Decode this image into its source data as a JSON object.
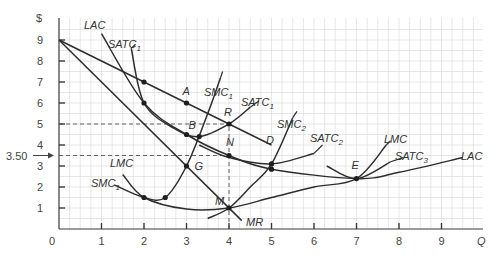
{
  "chart_data": {
    "type": "line",
    "title": "",
    "xlabel": "Q",
    "ylabel": "$",
    "xlim": [
      0,
      10
    ],
    "ylim": [
      0,
      9.5
    ],
    "grid": true,
    "x_ticks": [
      "1",
      "2",
      "3",
      "4",
      "5",
      "6",
      "7",
      "8",
      "9"
    ],
    "y_ticks": [
      "1",
      "2",
      "3",
      "4",
      "5",
      "6",
      "7",
      "8",
      "9"
    ],
    "origin_label": "0",
    "y_annotation": "3.50",
    "series": [
      {
        "name": "D",
        "points": [
          [
            0,
            9
          ],
          [
            2,
            7
          ],
          [
            3,
            6
          ],
          [
            4,
            5
          ],
          [
            5,
            4
          ]
        ]
      },
      {
        "name": "MR",
        "points": [
          [
            0,
            9
          ],
          [
            2,
            5
          ],
          [
            4,
            1
          ],
          [
            4.3,
            0.4
          ]
        ]
      },
      {
        "name": "LAC",
        "points": [
          [
            1,
            9.3
          ],
          [
            2,
            6
          ],
          [
            3,
            4.5
          ],
          [
            4,
            3.5
          ],
          [
            5,
            2.85
          ],
          [
            7,
            2.4
          ],
          [
            8,
            2.7
          ],
          [
            9.5,
            3.4
          ]
        ]
      },
      {
        "name": "SATC1",
        "points": [
          [
            1.7,
            8.6
          ],
          [
            2,
            6
          ],
          [
            2.7,
            4.8
          ],
          [
            3.3,
            4.4
          ],
          [
            4,
            5
          ],
          [
            4.5,
            5.8
          ]
        ]
      },
      {
        "name": "SMC1",
        "points": [
          [
            1.3,
            2.1
          ],
          [
            2,
            1.5
          ],
          [
            2.5,
            1.5
          ],
          [
            3,
            3
          ],
          [
            3.5,
            5.5
          ],
          [
            3.8,
            7.2
          ]
        ]
      },
      {
        "name": "SATC2",
        "points": [
          [
            3.3,
            4
          ],
          [
            4,
            3.4
          ],
          [
            5,
            3.1
          ],
          [
            6,
            3.6
          ]
        ]
      },
      {
        "name": "SMC2",
        "points": [
          [
            3.5,
            0.5
          ],
          [
            4,
            1
          ],
          [
            4.5,
            2
          ],
          [
            5,
            3.1
          ],
          [
            5.5,
            5.3
          ]
        ]
      },
      {
        "name": "SATC3",
        "points": [
          [
            6.3,
            3
          ],
          [
            7,
            2.4
          ],
          [
            7.8,
            3.2
          ]
        ]
      },
      {
        "name": "LMC",
        "points": [
          [
            1.5,
            2.6
          ],
          [
            2,
            1.5
          ],
          [
            3,
            0.95
          ],
          [
            4,
            1
          ],
          [
            5,
            1.5
          ],
          [
            6,
            2
          ],
          [
            7,
            2.4
          ],
          [
            7.7,
            4
          ]
        ]
      }
    ],
    "labeled_points": [
      {
        "label": "A",
        "q": 3,
        "p": 6
      },
      {
        "label": "B",
        "q": 3,
        "p": 4.5
      },
      {
        "label": "R",
        "q": 4,
        "p": 5
      },
      {
        "label": "N",
        "q": 4,
        "p": 3.5
      },
      {
        "label": "G",
        "q": 3,
        "p": 3
      },
      {
        "label": "M",
        "q": 4,
        "p": 1
      },
      {
        "label": "E",
        "q": 7,
        "p": 2.4
      }
    ],
    "unlabeled_points": [
      [
        2,
        7
      ],
      [
        2,
        6
      ],
      [
        2,
        1.5
      ],
      [
        2.5,
        1.5
      ],
      [
        3.3,
        4.4
      ],
      [
        5,
        3.1
      ],
      [
        5,
        2.85
      ]
    ],
    "reference_lines": [
      {
        "type": "horizontal",
        "y": 5,
        "x_to": 4
      },
      {
        "type": "horizontal",
        "y": 3.5,
        "x_to": 4
      },
      {
        "type": "vertical",
        "x": 4,
        "y_from": 0,
        "y_to": 5
      }
    ],
    "curve_labels": [
      {
        "text": "LAC",
        "sub": "",
        "x": 84,
        "y": 29
      },
      {
        "text": "SATC",
        "sub": "1",
        "x": 108,
        "y": 48
      },
      {
        "text": "SMC",
        "sub": "1",
        "x": 204,
        "y": 96
      },
      {
        "text": "SATC",
        "sub": "1",
        "x": 241,
        "y": 106
      },
      {
        "text": "D",
        "sub": "",
        "x": 266,
        "y": 144
      },
      {
        "text": "SMC",
        "sub": "2",
        "x": 277,
        "y": 128
      },
      {
        "text": "SATC",
        "sub": "2",
        "x": 310,
        "y": 142
      },
      {
        "text": "LMC",
        "sub": "",
        "x": 384,
        "y": 143
      },
      {
        "text": "SATC",
        "sub": "3",
        "x": 395,
        "y": 160
      },
      {
        "text": "LAC",
        "sub": "",
        "x": 461,
        "y": 160
      },
      {
        "text": "LMC",
        "sub": "",
        "x": 110,
        "y": 167
      },
      {
        "text": "SMC",
        "sub": "1",
        "x": 91,
        "y": 187
      },
      {
        "text": "MR",
        "sub": "",
        "x": 246,
        "y": 226
      }
    ]
  }
}
